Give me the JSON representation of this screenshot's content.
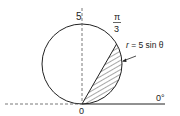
{
  "diagram": {
    "type": "polar-region",
    "labels": {
      "top_value": "5",
      "angle_num": "π",
      "angle_den": "3",
      "curve": "r = 5 sin θ",
      "curve_r": "r",
      "curve_rest": " = 5 sin θ",
      "origin": "0",
      "initial_line": "0°"
    },
    "curve_equation": "r = 5 sin θ",
    "shaded_region": "between chord θ = π/3 and arc of r = 5 sin θ",
    "colors": {
      "stroke": "#222222",
      "dashed": "#555555",
      "background": "#ffffff"
    }
  }
}
